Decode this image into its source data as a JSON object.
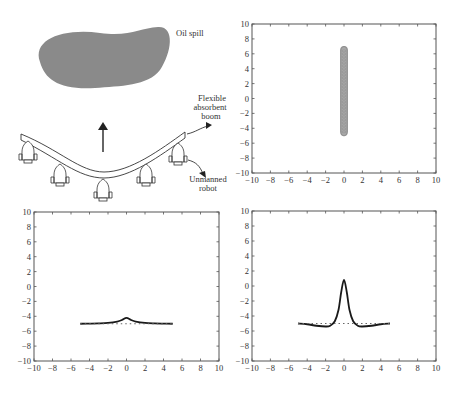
{
  "illustration": {
    "labels": {
      "oil_spill": "Oil spill",
      "boom_line1": "Flexible",
      "boom_line2": "absorbent",
      "boom_line3": "boom",
      "robot_line1": "Unmanned",
      "robot_line2": "robot"
    },
    "colors": {
      "oil": "#8a8a8a",
      "stroke": "#333333"
    },
    "robot_count": 5
  },
  "chart_data": [
    {
      "type": "scatter",
      "panel": "top-right",
      "title": "",
      "xlabel": "",
      "ylabel": "",
      "xlim": [
        -10,
        10
      ],
      "ylim": [
        -10,
        10
      ],
      "xticks": [
        -10,
        -8,
        -6,
        -4,
        -2,
        0,
        2,
        4,
        6,
        8,
        10
      ],
      "yticks": [
        -10,
        -8,
        -6,
        -4,
        -2,
        0,
        2,
        4,
        6,
        8,
        10
      ],
      "series": [
        {
          "name": "boom nodes",
          "x": [
            0,
            0
          ],
          "y": [
            -5,
            7
          ],
          "style": "dense vertical column of gray markers"
        }
      ]
    },
    {
      "type": "line",
      "panel": "bottom-left",
      "title": "",
      "xlabel": "",
      "ylabel": "",
      "xlim": [
        -10,
        10
      ],
      "ylim": [
        -10,
        10
      ],
      "xticks": [
        -10,
        -8,
        -6,
        -4,
        -2,
        0,
        2,
        4,
        6,
        8,
        10
      ],
      "yticks": [
        -10,
        -8,
        -6,
        -4,
        -2,
        0,
        2,
        4,
        6,
        8,
        10
      ],
      "series": [
        {
          "name": "boom shape",
          "x": [
            -5,
            -4,
            -3,
            -2,
            -1,
            -0.5,
            0,
            0.5,
            1,
            2,
            3,
            4,
            5
          ],
          "y": [
            -5.0,
            -4.98,
            -4.95,
            -4.88,
            -4.7,
            -4.5,
            -4.2,
            -4.5,
            -4.7,
            -4.88,
            -4.95,
            -4.98,
            -5.0
          ],
          "style": "solid"
        },
        {
          "name": "baseline",
          "x": [
            -5,
            5
          ],
          "y": [
            -5,
            -5
          ],
          "style": "dotted"
        }
      ]
    },
    {
      "type": "line",
      "panel": "bottom-right",
      "title": "",
      "xlabel": "",
      "ylabel": "",
      "xlim": [
        -10,
        10
      ],
      "ylim": [
        -10,
        10
      ],
      "xticks": [
        -10,
        -8,
        -6,
        -4,
        -2,
        0,
        2,
        4,
        6,
        8,
        10
      ],
      "yticks": [
        -10,
        -8,
        -6,
        -4,
        -2,
        0,
        2,
        4,
        6,
        8,
        10
      ],
      "series": [
        {
          "name": "boom shape",
          "x": [
            -5,
            -4,
            -3,
            -2,
            -1.5,
            -1,
            -0.6,
            -0.3,
            0,
            0.3,
            0.6,
            1,
            1.5,
            2,
            3,
            4,
            5
          ],
          "y": [
            -5.0,
            -5.1,
            -5.3,
            -5.4,
            -5.3,
            -4.7,
            -3.2,
            -0.8,
            0.8,
            -0.8,
            -3.2,
            -4.7,
            -5.3,
            -5.4,
            -5.3,
            -5.1,
            -5.0
          ],
          "style": "solid"
        },
        {
          "name": "baseline",
          "x": [
            -5,
            5
          ],
          "y": [
            -5,
            -5
          ],
          "style": "dotted"
        }
      ]
    }
  ]
}
